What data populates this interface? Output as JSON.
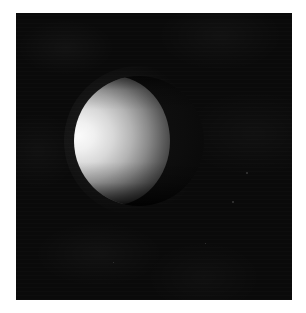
{
  "image": {
    "kind": "astronomical-photograph",
    "subject": "planetary-body-gibbous-phase",
    "caption": "",
    "frame": {
      "canvas_width_px": 306,
      "canvas_height_px": 313,
      "margin_color": "#ffffff",
      "sky_left_px": 16,
      "sky_top_px": 13,
      "sky_width_px": 276,
      "sky_height_px": 287,
      "sky_color": "#0a0a0a"
    },
    "body": {
      "label": "planetary-disc",
      "center_x_px": 123,
      "center_y_px": 141,
      "diameter_px": 130,
      "phase": "gibbous",
      "illuminated_side": "left",
      "terminator_side": "left-straight-edge",
      "limb_side": "right-curved",
      "brightest_point_x_px": 98,
      "brightest_point_y_px": 128,
      "highlight_color": "#fbfbfb",
      "midtone_color": "#b4b4b4",
      "shadow_color": "#0b0b0b",
      "night_side_color": "#121212"
    },
    "specks": [
      {
        "x_px": 246,
        "y_px": 172,
        "size_px": 2,
        "color": "#3a3a3a"
      },
      {
        "x_px": 232,
        "y_px": 201,
        "size_px": 2,
        "color": "#343434"
      },
      {
        "x_px": 205,
        "y_px": 243,
        "size_px": 1,
        "color": "#2e2e2e"
      },
      {
        "x_px": 113,
        "y_px": 262,
        "size_px": 1,
        "color": "#2a2a2a"
      }
    ]
  }
}
